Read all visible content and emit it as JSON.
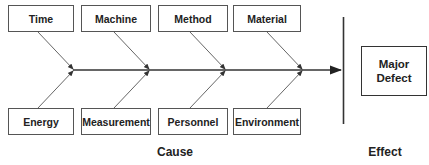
{
  "diagram": {
    "type": "fishbone",
    "causes_top": [
      {
        "label": "Time"
      },
      {
        "label": "Machine"
      },
      {
        "label": "Method"
      },
      {
        "label": "Material"
      }
    ],
    "causes_bottom": [
      {
        "label": "Energy"
      },
      {
        "label": "Measurement"
      },
      {
        "label": "Personnel"
      },
      {
        "label": "Environment"
      }
    ],
    "effect": {
      "label": "Major\nDefect"
    },
    "captions": {
      "cause": "Cause",
      "effect": "Effect"
    },
    "colors": {
      "line": "#444444",
      "box_border": "#555555",
      "text": "#222222"
    }
  }
}
